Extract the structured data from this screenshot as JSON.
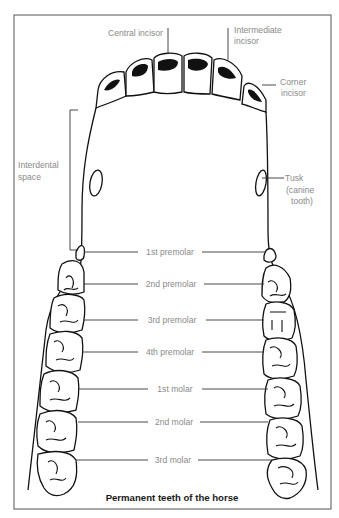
{
  "figure": {
    "caption": "Permanent teeth of the horse",
    "labels": {
      "central_incisor": "Central incisor",
      "intermediate_incisor_1": "Intermediate",
      "intermediate_incisor_2": "incisor",
      "corner_incisor_1": "Corner",
      "corner_incisor_2": "incisor",
      "interdental_space_1": "Interdental",
      "interdental_space_2": "space",
      "tusk_1": "Tusk",
      "tusk_2": "(canine",
      "tusk_3": "tooth)",
      "premolar_1": "1st premolar",
      "premolar_2": "2nd premolar",
      "premolar_3": "3rd premolar",
      "premolar_4": "4th premolar",
      "molar_1": "1st molar",
      "molar_2": "2nd molar",
      "molar_3": "3rd molar"
    }
  }
}
